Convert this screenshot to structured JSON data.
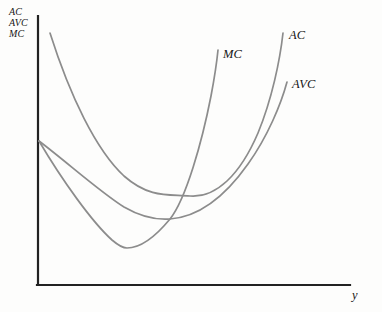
{
  "figure": {
    "background_color": "#fdfdfc",
    "axis_color": "#222222",
    "curve_color": "#8c8c8c"
  },
  "axes": {
    "vertical_label_lines": [
      {
        "text": "AC"
      },
      {
        "text": "AVC"
      },
      {
        "text": "MC"
      }
    ],
    "horizontal_label": "y",
    "origin": {
      "x": 38,
      "y": 285
    },
    "y_axis_top": {
      "x": 38,
      "y": 16
    },
    "x_axis_right": {
      "x": 350,
      "y": 285
    }
  },
  "curve_labels": {
    "mc": "MC",
    "ac": "AC",
    "avc": "AVC"
  },
  "chart_data": {
    "type": "line",
    "title": "",
    "xlabel": "y",
    "ylabel": "AC, AVC, MC",
    "grid": false,
    "legend_position": "inline-at-curve-ends",
    "axis_ranges": {
      "x_pixels": [
        38,
        350
      ],
      "y_pixels": [
        16,
        285
      ]
    },
    "annotations": [
      "MC intersects AVC at the minimum of AVC",
      "MC intersects AC at the minimum of AC",
      "AVC lies below AC everywhere; gap narrows as output rises"
    ],
    "series": [
      {
        "name": "AC",
        "label": "AC",
        "minimum_point": {
          "x": 190,
          "y": 196
        },
        "start_point": {
          "x": 50,
          "y": 33
        },
        "end_point": {
          "x": 283,
          "y": 33
        },
        "path": "M 50,33 C 70,96 96,150 124,176 C 150,199 170,194 190,196 C 216,198 240,175 258,133 C 272,99 280,60 283,33"
      },
      {
        "name": "AVC",
        "label": "AVC",
        "minimum_point": {
          "x": 170,
          "y": 219
        },
        "start_point": {
          "x": 39,
          "y": 141
        },
        "end_point": {
          "x": 287,
          "y": 82
        },
        "path": "M 39,141 C 68,163 100,192 124,207 C 143,218 157,220 170,219 C 197,217 224,198 248,164 C 268,136 281,104 287,82"
      },
      {
        "name": "MC",
        "label": "MC",
        "minimum_point": {
          "x": 127,
          "y": 248
        },
        "start_point": {
          "x": 39,
          "y": 141
        },
        "end_point": {
          "x": 218,
          "y": 50
        },
        "path": "M 39,141 C 62,180 92,222 112,240 C 119,246 124,248 127,248 C 142,248 156,236 170,219 C 186,199 202,142 211,96 C 215,75 217,60 218,50"
      }
    ]
  }
}
